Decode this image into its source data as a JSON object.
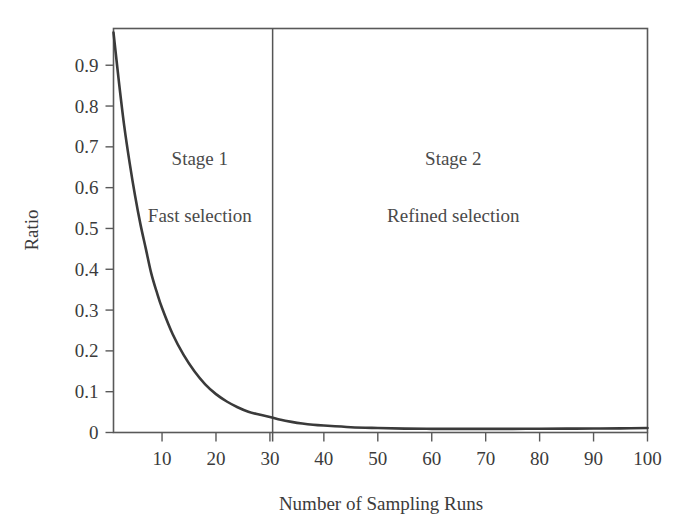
{
  "chart_data": {
    "type": "line",
    "title": "",
    "xlabel": "Number of Sampling Runs",
    "ylabel": "Ratio",
    "xlim": [
      1,
      100
    ],
    "ylim": [
      0,
      0.99
    ],
    "grid": false,
    "legend_position": "none",
    "xticks": [
      10,
      20,
      30,
      40,
      50,
      60,
      70,
      80,
      90,
      100
    ],
    "xtick_labels": [
      "10",
      "20",
      "30",
      "40",
      "50",
      "60",
      "70",
      "80",
      "90",
      "100"
    ],
    "yticks": [
      0,
      0.1,
      0.2,
      0.3,
      0.4,
      0.5,
      0.6,
      0.7,
      0.8,
      0.9
    ],
    "ytick_labels": [
      "0",
      "0.1",
      "0.2",
      "0.3",
      "0.4",
      "0.5",
      "0.6",
      "0.7",
      "0.8",
      "0.9"
    ],
    "series": [
      {
        "name": "Ratio",
        "color": "#3a3a3a",
        "x": [
          1,
          2,
          3,
          4,
          5,
          6,
          7,
          8,
          9,
          10,
          12,
          14,
          16,
          18,
          20,
          22,
          24,
          26,
          28,
          30,
          32,
          34,
          36,
          38,
          40,
          45,
          50,
          55,
          60,
          65,
          70,
          75,
          80,
          85,
          90,
          95,
          100
        ],
        "values": [
          0.98,
          0.86,
          0.75,
          0.66,
          0.58,
          0.51,
          0.45,
          0.39,
          0.345,
          0.305,
          0.24,
          0.19,
          0.15,
          0.118,
          0.094,
          0.076,
          0.062,
          0.051,
          0.044,
          0.038,
          0.031,
          0.026,
          0.022,
          0.019,
          0.017,
          0.013,
          0.011,
          0.0095,
          0.009,
          0.0088,
          0.0088,
          0.009,
          0.0092,
          0.0095,
          0.0098,
          0.0102,
          0.011
        ]
      }
    ],
    "annotations": [
      {
        "text": "Stage 1",
        "x": 17,
        "y": 0.655
      },
      {
        "text": "Fast selection",
        "x": 17,
        "y": 0.515
      },
      {
        "text": "Stage 2",
        "x": 64,
        "y": 0.655
      },
      {
        "text": "Refined selection",
        "x": 64,
        "y": 0.515
      }
    ],
    "divider": {
      "x": 30.5,
      "label": "stage-boundary"
    }
  },
  "axes": {
    "y_axis_title": "Ratio",
    "x_axis_title": "Number of Sampling Runs"
  },
  "colors": {
    "curve": "#3a3a3a",
    "frame": "#595959",
    "divider": "#555555",
    "text": "#3b3b3b",
    "annotation_text": "#4a4a4a",
    "background": "#ffffff"
  }
}
